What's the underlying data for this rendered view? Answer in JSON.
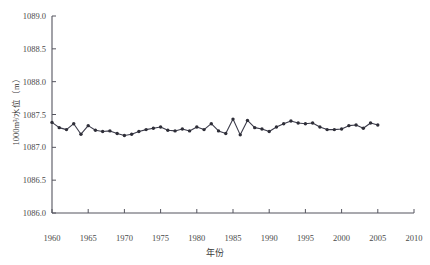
{
  "chart_data": {
    "type": "line",
    "title": "",
    "xlabel": "年份",
    "ylabel": "1000m³/水位（m）",
    "xlim": [
      1960,
      2010
    ],
    "ylim": [
      1086.0,
      1089.0
    ],
    "xticks": [
      1960,
      1965,
      1970,
      1975,
      1980,
      1985,
      1990,
      1995,
      2000,
      2005,
      2010
    ],
    "yticks": [
      "1086.0",
      "1086.5",
      "1087.0",
      "1087.5",
      "1088.0",
      "1088.5",
      "1089.0"
    ],
    "grid": false,
    "legend": "none",
    "marker": "filled-circle",
    "line_color": "#3b3b4a",
    "marker_color": "#2e2e38",
    "series": [
      {
        "name": "水位",
        "x": [
          1960,
          1961,
          1962,
          1963,
          1964,
          1965,
          1966,
          1967,
          1968,
          1969,
          1970,
          1971,
          1972,
          1973,
          1974,
          1975,
          1976,
          1977,
          1978,
          1979,
          1980,
          1981,
          1982,
          1983,
          1984,
          1985,
          1986,
          1987,
          1988,
          1989,
          1990,
          1991,
          1992,
          1993,
          1994,
          1995,
          1996,
          1997,
          1998,
          1999,
          2000,
          2001,
          2002,
          2003,
          2004,
          2005
        ],
        "values": [
          1087.38,
          1087.3,
          1087.27,
          1087.36,
          1087.2,
          1087.33,
          1087.26,
          1087.24,
          1087.25,
          1087.21,
          1087.18,
          1087.2,
          1087.24,
          1087.27,
          1087.29,
          1087.31,
          1087.26,
          1087.25,
          1087.28,
          1087.25,
          1087.31,
          1087.27,
          1087.36,
          1087.25,
          1087.21,
          1087.43,
          1087.19,
          1087.41,
          1087.3,
          1087.28,
          1087.24,
          1087.31,
          1087.36,
          1087.4,
          1087.37,
          1087.36,
          1087.37,
          1087.31,
          1087.27,
          1087.27,
          1087.28,
          1087.33,
          1087.34,
          1087.29,
          1087.37,
          1087.34
        ]
      }
    ]
  },
  "axes": {
    "x_title": "年份",
    "y_title": "1000m³/水位（m）"
  }
}
